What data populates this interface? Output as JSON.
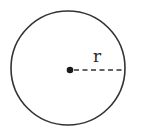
{
  "diagram": {
    "title": "",
    "shape": "circle",
    "radius_label": "r",
    "stroke_color": "#333333",
    "background": "#ffffff"
  }
}
